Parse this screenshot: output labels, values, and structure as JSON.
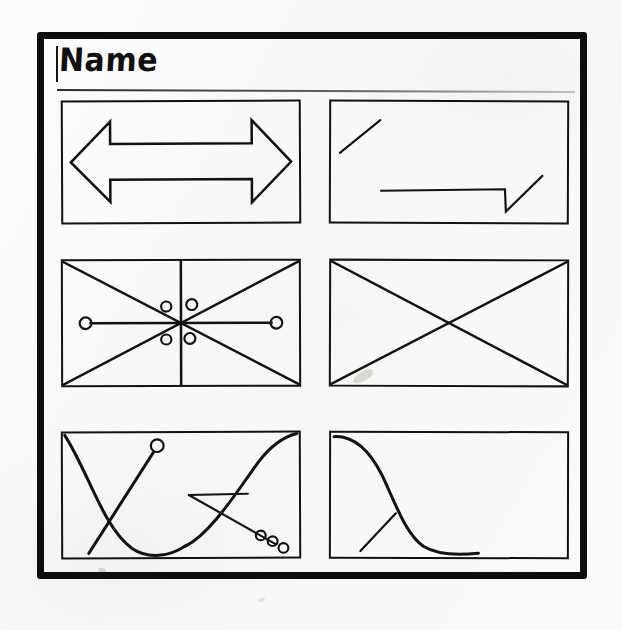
{
  "document": {
    "kind": "hand-drawn-wireframe-sketch",
    "background_color": "#fbfbfa",
    "ink_color": "#121212",
    "frame": {
      "name": "outer-sketch-frame",
      "border_width_px": 7
    }
  },
  "header": {
    "title": "Name",
    "rule_visible": true
  },
  "panels": [
    {
      "index": 1,
      "position": "row-1-left",
      "sketch_name": "double-headed-horizontal-arrow",
      "description": "A wide double-headed arrow pointing left and right, drawn as an outline.",
      "elements": [
        "arrow-left-head",
        "arrow-right-head",
        "arrow-shaft"
      ]
    },
    {
      "index": 2,
      "position": "row-1-right",
      "sketch_name": "diagonal-line-and-checkmark-baseline",
      "description": "A short upward diagonal stroke at the upper left; a long horizontal baseline at lower right that drops down then rises as a diagonal, forming a tick.",
      "elements": [
        "short-diagonal-stroke",
        "horizontal-baseline",
        "down-tick",
        "rising-diagonal"
      ]
    },
    {
      "index": 3,
      "position": "row-2-left",
      "sketch_name": "crossed-box-with-node-cluster",
      "description": "Rectangle with both corner-to-corner diagonals, a vertical centre line, a horizontal line terminating in a circle at each end, and four small circles clustered around the centre point.",
      "elements": [
        "diagonal-down-right",
        "diagonal-up-right",
        "vertical-center-line",
        "horizontal-axis-line",
        "end-node-left",
        "end-node-right",
        "center-node-cluster-4"
      ]
    },
    {
      "index": 4,
      "position": "row-2-right",
      "sketch_name": "empty-image-placeholder-box",
      "description": "Plain rectangle with two corner-to-corner diagonals forming an X, the classic empty/placeholder image symbol.",
      "elements": [
        "diagonal-down-right",
        "diagonal-up-right"
      ]
    },
    {
      "index": 5,
      "position": "row-3-left",
      "sketch_name": "curve-pair-with-pointer-and-node-trail",
      "description": "A falling curve from the top-left to the bottom, a rising curve up to the top-right, a straight diagonal with a circle handle at its top, a horizontal line joined to a downward diagonal, and three small circles trailing toward the bottom-right corner.",
      "elements": [
        "falling-curve",
        "rising-curve",
        "pointer-diagonal",
        "pointer-handle-circle",
        "horizontal-connector",
        "connector-diagonal",
        "node-trail-3"
      ]
    },
    {
      "index": 6,
      "position": "row-3-right",
      "sketch_name": "sigmoid-decay-curve-with-tick",
      "description": "A descending sigmoid (S-shaped) curve starting at the top-left, flattening along the bottom, crossed near its lower bend by a short straight tick line from the lower left.",
      "elements": [
        "sigmoid-curve",
        "crossing-tick-line"
      ]
    }
  ],
  "annotations": {
    "smudges": [
      "pencil-smudge-center",
      "pencil-smudge-lower-left",
      "pencil-smudge-bottom"
    ]
  }
}
